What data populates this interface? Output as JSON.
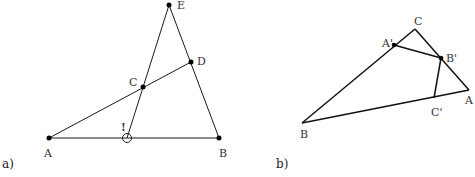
{
  "figure_a": {
    "caption": "a)",
    "points": {
      "A": {
        "label": "A",
        "x": 49,
        "y": 138
      },
      "B": {
        "label": "B",
        "x": 219,
        "y": 138
      },
      "C": {
        "label": "C",
        "x": 143,
        "y": 87
      },
      "D": {
        "label": "D",
        "x": 191,
        "y": 62
      },
      "E": {
        "label": "E",
        "x": 169,
        "y": 5
      }
    },
    "marker": {
      "symbol": "!",
      "circle_x": 127,
      "circle_y": 138
    }
  },
  "figure_b": {
    "caption": "b)",
    "points": {
      "A": {
        "label": "A",
        "x": 469,
        "y": 90
      },
      "B": {
        "label": "B",
        "x": 302,
        "y": 123
      },
      "C": {
        "label": "C",
        "x": 415,
        "y": 29
      },
      "A_prime": {
        "label": "A'",
        "x": 394,
        "y": 45
      },
      "B_prime": {
        "label": "B'",
        "x": 441,
        "y": 58
      },
      "C_prime": {
        "label": "C'",
        "x": 434,
        "y": 98
      }
    }
  }
}
